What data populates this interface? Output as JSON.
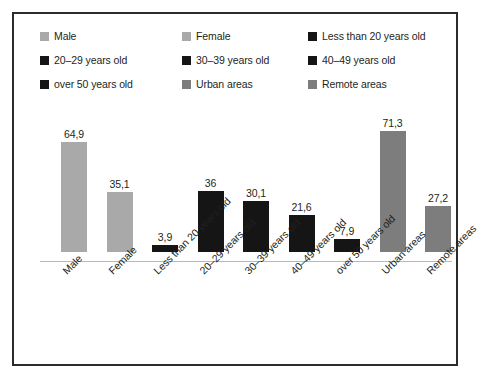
{
  "chart_data": {
    "type": "bar",
    "title": "",
    "subtitle": "",
    "xlabel": "",
    "ylabel": "",
    "grid": false,
    "ylim": [
      0,
      80
    ],
    "decimal_separator": ",",
    "legend_position": "top",
    "categories": [
      "Male",
      "Female",
      "Less than 20 years old",
      "20–29 years old",
      "30–39 years old",
      "40–49 years old",
      "over 50 years old",
      "Urban areas",
      "Remote areas"
    ],
    "values": [
      64.9,
      35.1,
      3.9,
      36,
      30.1,
      21.6,
      7.9,
      71.3,
      27.2
    ],
    "value_labels": [
      "64,9",
      "35,1",
      "3,9",
      "36",
      "30,1",
      "21,6",
      "7,9",
      "71,3",
      "27,2"
    ],
    "bar_colors": [
      "#a9a9a9",
      "#a9a9a9",
      "#151515",
      "#151515",
      "#151515",
      "#151515",
      "#151515",
      "#7d7d7d",
      "#7d7d7d"
    ]
  },
  "legend": {
    "items": [
      {
        "label": "Male",
        "color": "#a9a9a9"
      },
      {
        "label": "Female",
        "color": "#a9a9a9"
      },
      {
        "label": "Less than 20 years old",
        "color": "#151515"
      },
      {
        "label": "20–29 years old",
        "color": "#151515"
      },
      {
        "label": "30–39 years old",
        "color": "#151515"
      },
      {
        "label": "40–49 years old",
        "color": "#151515"
      },
      {
        "label": "over 50 years old",
        "color": "#151515"
      },
      {
        "label": "Urban areas",
        "color": "#7d7d7d"
      },
      {
        "label": "Remote areas",
        "color": "#7d7d7d"
      }
    ]
  },
  "colors": {
    "frame": "#2b2b2b",
    "background": "#ffffff",
    "text": "#231f20",
    "axis": "#b9b9b9",
    "light_gray": "#a9a9a9",
    "mid_gray": "#7d7d7d",
    "black": "#151515"
  }
}
